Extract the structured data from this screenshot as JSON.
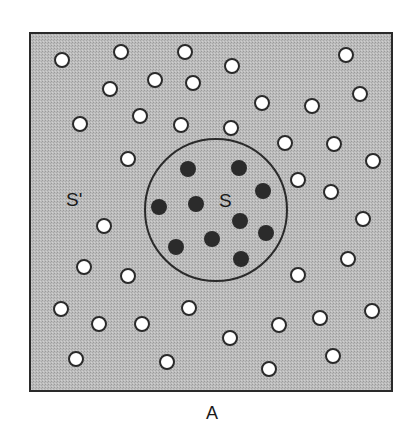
{
  "diagram": {
    "title_label": "A",
    "region_outer_label": "S'",
    "region_inner_label": "S",
    "colors": {
      "background": "#ffffff",
      "field_fill": "#b8b8b8",
      "border": "#2a2a2a",
      "open_circle_fill": "#ffffff",
      "open_circle_stroke": "#2a2a2a",
      "filled_circle": "#2b2b2b"
    },
    "square": {
      "x": 30,
      "y": 33,
      "width": 362,
      "height": 358
    },
    "inner_region": {
      "cx": 216,
      "cy": 210,
      "r": 71
    },
    "open_circles": [
      [
        62,
        60
      ],
      [
        121,
        52
      ],
      [
        185,
        52
      ],
      [
        232,
        66
      ],
      [
        346,
        55
      ],
      [
        110,
        89
      ],
      [
        155,
        80
      ],
      [
        193,
        83
      ],
      [
        262,
        103
      ],
      [
        312,
        106
      ],
      [
        360,
        94
      ],
      [
        80,
        124
      ],
      [
        140,
        116
      ],
      [
        181,
        125
      ],
      [
        231,
        128
      ],
      [
        285,
        143
      ],
      [
        334,
        144
      ],
      [
        373,
        161
      ],
      [
        128,
        159
      ],
      [
        298,
        180
      ],
      [
        331,
        192
      ],
      [
        104,
        226
      ],
      [
        363,
        219
      ],
      [
        84,
        267
      ],
      [
        128,
        276
      ],
      [
        348,
        259
      ],
      [
        298,
        275
      ],
      [
        61,
        309
      ],
      [
        99,
        324
      ],
      [
        142,
        324
      ],
      [
        189,
        308
      ],
      [
        279,
        325
      ],
      [
        320,
        318
      ],
      [
        372,
        311
      ],
      [
        76,
        359
      ],
      [
        167,
        362
      ],
      [
        230,
        338
      ],
      [
        269,
        369
      ],
      [
        333,
        356
      ]
    ],
    "filled_circles": [
      [
        188,
        169
      ],
      [
        239,
        168
      ],
      [
        263,
        191
      ],
      [
        159,
        207
      ],
      [
        196,
        204
      ],
      [
        240,
        221
      ],
      [
        266,
        233
      ],
      [
        176,
        247
      ],
      [
        212,
        239
      ],
      [
        241,
        259
      ]
    ]
  }
}
